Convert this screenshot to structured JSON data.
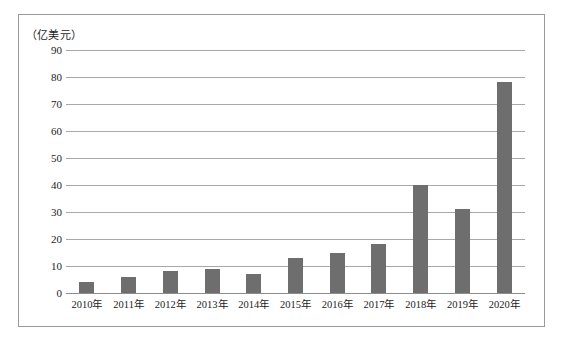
{
  "figure": {
    "unit_caption": "（亿美元）"
  },
  "chart_data": {
    "type": "bar",
    "title": "",
    "subtitle": "",
    "xlabel": "",
    "ylabel": "（亿美元）",
    "categories": [
      "2010年",
      "2011年",
      "2012年",
      "2013年",
      "2014年",
      "2015年",
      "2016年",
      "2017年",
      "2018年",
      "2019年",
      "2020年"
    ],
    "values": [
      4,
      6,
      8,
      9,
      7,
      13,
      15,
      18,
      40,
      31,
      78
    ],
    "series": [
      {
        "name": "",
        "values": [
          4,
          6,
          8,
          9,
          7,
          13,
          15,
          18,
          40,
          31,
          78
        ]
      }
    ],
    "ylim": [
      0,
      90
    ],
    "ytick_values": [
      0,
      10,
      20,
      30,
      40,
      50,
      60,
      70,
      80,
      90
    ],
    "ytick_labels": [
      "0",
      "10",
      "20",
      "30",
      "40",
      "50",
      "60",
      "70",
      "80",
      "90"
    ],
    "grid": true,
    "grid_axis": "y",
    "legend": false,
    "legend_position": "none",
    "bar_color": "#6e6e6e",
    "grid_color": "#a8a8a8",
    "frame_color": "#9a9a9a",
    "background_color": "#ffffff"
  }
}
